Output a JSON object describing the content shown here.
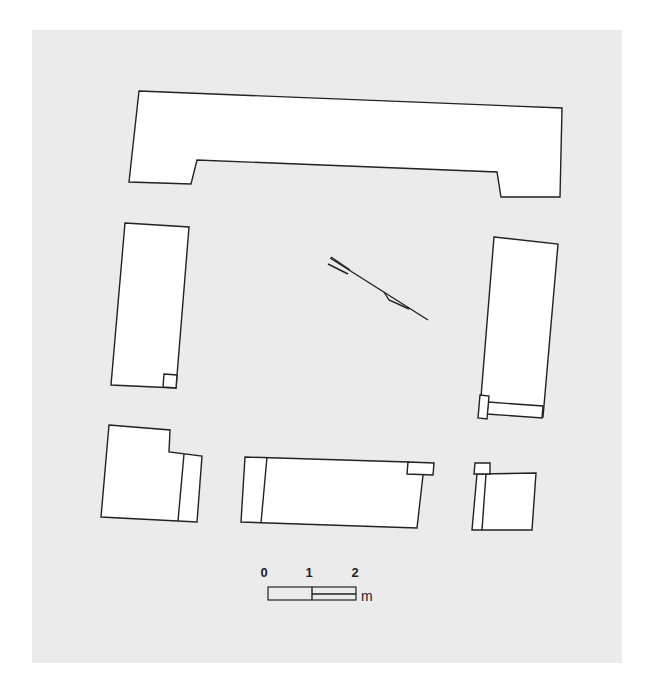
{
  "figure": {
    "type": "architectural plan",
    "background_color": "#ebebeb",
    "stroke_color": "#222222",
    "fill_color": "#ffffff"
  },
  "blocks": [
    {
      "id": "top-slab"
    },
    {
      "id": "left-upright"
    },
    {
      "id": "right-upright"
    },
    {
      "id": "bottom-left-block"
    },
    {
      "id": "bottom-middle-block"
    },
    {
      "id": "bottom-right-block"
    }
  ],
  "north_arrow": {
    "icon": "north-arrow-icon"
  },
  "scale_bar": {
    "labels": [
      "0",
      "1",
      "2"
    ],
    "unit": "m"
  }
}
